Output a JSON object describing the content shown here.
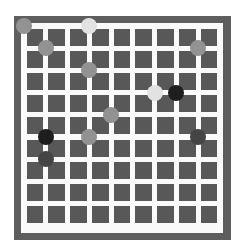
{
  "board": {
    "size": 10,
    "origin_x": 24,
    "origin_y": 26,
    "spacing_x": 21.75,
    "spacing_y": 22.2,
    "colors": {
      "frame": "#5e5e5e",
      "lines": "#fafafa",
      "cells": "#585858",
      "stone_black": "#1e1e1e",
      "stone_dark": "#454545",
      "stone_gray": "#929292",
      "stone_light": "#e2e2e2"
    }
  },
  "stones": [
    {
      "col": 0,
      "row": 0,
      "color": "gray"
    },
    {
      "col": 3,
      "row": 0,
      "color": "light"
    },
    {
      "col": 1,
      "row": 1,
      "color": "gray"
    },
    {
      "col": 8,
      "row": 1,
      "color": "gray"
    },
    {
      "col": 3,
      "row": 2,
      "color": "gray"
    },
    {
      "col": 6,
      "row": 3,
      "color": "light"
    },
    {
      "col": 7,
      "row": 3,
      "color": "black"
    },
    {
      "col": 4,
      "row": 4,
      "color": "gray"
    },
    {
      "col": 1,
      "row": 5,
      "color": "black"
    },
    {
      "col": 3,
      "row": 5,
      "color": "gray"
    },
    {
      "col": 8,
      "row": 5,
      "color": "dark"
    },
    {
      "col": 1,
      "row": 6,
      "color": "dark"
    }
  ]
}
